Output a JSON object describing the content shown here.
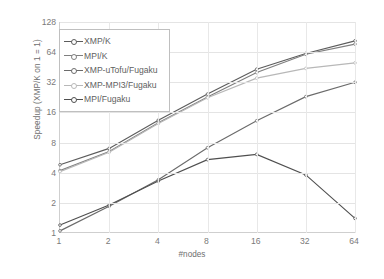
{
  "chart_data": {
    "type": "line",
    "title": "",
    "xlabel": "#nodes",
    "ylabel": "Speedup (XMP/K on 1 = 1)",
    "x": [
      1,
      2,
      4,
      8,
      16,
      32,
      64
    ],
    "xtick_labels": [
      "1",
      "2",
      "4",
      "8",
      "16",
      "32",
      "64"
    ],
    "ytick_labels": [
      "1",
      "2",
      "4",
      "8",
      "16",
      "32",
      "64",
      "128"
    ],
    "ytick_values": [
      1,
      2,
      4,
      8,
      16,
      32,
      64,
      128
    ],
    "xscale": "log2",
    "yscale": "log2",
    "ylim": [
      1,
      128
    ],
    "xlim": [
      1,
      64
    ],
    "grid": true,
    "legend_position": "upper-left-inside",
    "series": [
      {
        "name": "XMP/K",
        "color": "#5c5c5c",
        "marker": "dot",
        "values": [
          4.8,
          7.0,
          13.4,
          24.4,
          43.2,
          62.0,
          83.0
        ]
      },
      {
        "name": "MPI/K",
        "color": "#7f7f7f",
        "marker": "dot",
        "values": [
          4.2,
          6.5,
          12.6,
          22.8,
          40.0,
          61.0,
          77.0
        ]
      },
      {
        "name": "XMP-uTofu/Fugaku",
        "color": "#6b6b6b",
        "marker": "dot",
        "values": [
          1.05,
          1.85,
          3.4,
          7.1,
          13.2,
          23.0,
          32.0
        ]
      },
      {
        "name": "XMP-MPI3/Fugaku",
        "color": "#b8b8b8",
        "marker": "dot",
        "values": [
          4.1,
          6.4,
          12.4,
          22.4,
          35.2,
          44.0,
          50.0
        ]
      },
      {
        "name": "MPI/Fugaku",
        "color": "#4f4f4f",
        "marker": "dot",
        "values": [
          1.2,
          1.9,
          3.3,
          5.4,
          6.1,
          3.8,
          1.4
        ]
      }
    ]
  }
}
